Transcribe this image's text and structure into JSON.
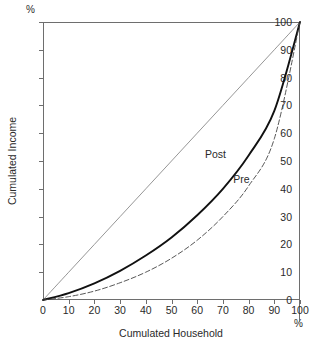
{
  "chart_data": {
    "type": "line",
    "title": "",
    "xlabel": "Cumulated Household",
    "ylabel": "Cumulated Income",
    "x_unit": "%",
    "y_unit": "%",
    "xlim": [
      0,
      100
    ],
    "ylim": [
      0,
      100
    ],
    "grid": false,
    "legend_position": "inline-annotation",
    "xticks": [
      "0",
      "10",
      "20",
      "30",
      "40",
      "50",
      "60",
      "70",
      "80",
      "90",
      "100"
    ],
    "yticks": [
      "0",
      "10",
      "20",
      "30",
      "40",
      "50",
      "60",
      "70",
      "80",
      "90",
      "100"
    ],
    "x": [
      0,
      10,
      20,
      30,
      40,
      50,
      60,
      70,
      80,
      90,
      100
    ],
    "series": [
      {
        "name": "Equality",
        "style": "solid-thin",
        "color": "#8a8a8a",
        "values": [
          0,
          10,
          20,
          30,
          40,
          50,
          60,
          70,
          80,
          90,
          100
        ]
      },
      {
        "name": "Post",
        "style": "solid-bold",
        "color": "#111111",
        "values": [
          0,
          2.5,
          6,
          10.5,
          16,
          22.5,
          30.5,
          40,
          52,
          68,
          100
        ]
      },
      {
        "name": "Pre",
        "style": "dashed-thin",
        "color": "#444444",
        "values": [
          0,
          1.2,
          3.2,
          6.2,
          10,
          15,
          21.5,
          30,
          41,
          58,
          100
        ]
      }
    ],
    "annotations": [
      {
        "text": "Post",
        "x": 63,
        "y": 52
      },
      {
        "text": "Pre",
        "x": 74,
        "y": 43
      }
    ]
  }
}
